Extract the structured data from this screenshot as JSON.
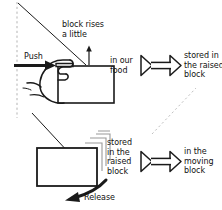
{
  "diagram": {
    "canvas": {
      "width": 222,
      "height": 210,
      "background": "#ffffff"
    },
    "ink_color": "#1a1a1a",
    "guide_color": "#b9b9b9",
    "labels": {
      "push": "Push",
      "block_rises": "block rises\na little",
      "in_our_food": "in our\nfood",
      "stored_in_raised_block_top": "stored in\nthe raised\nblock",
      "stored_in_raised_block_bottom": "stored\nin the\nraised\nblock",
      "in_the_moving_block": "in the\nmoving\nblock",
      "release": "Release"
    },
    "panels": [
      {
        "name": "push-panel",
        "action": "Push",
        "effect": "block rises a little",
        "energy_from": "in our food",
        "energy_to": "stored in the raised block"
      },
      {
        "name": "release-panel",
        "action": "Release",
        "effect": "block moves",
        "energy_from": "stored in the raised block",
        "energy_to": "in the moving block"
      }
    ],
    "icons": {
      "push_arrow": "arrow-right-icon",
      "rise_arrow": "arrow-up-icon",
      "energy_arrow": "double-triangle-energy-arrow-icon",
      "release_arrow": "curved-arrow-down-left-icon",
      "hand": "hand-pushing-icon",
      "block": "block-rectangle-icon",
      "motion_trail": "motion-trail-icon"
    }
  }
}
